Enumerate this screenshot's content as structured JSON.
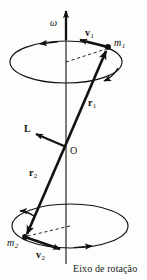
{
  "figure": {
    "kind": "physics-vector-diagram",
    "language": "pt-BR",
    "background_color": "#fdfdfb",
    "ink_color": "#111111",
    "caption": "Eixo de rotação",
    "labels": {
      "omega": "ω",
      "velocity_1": "v",
      "velocity_1_sub": "1",
      "mass_1": "m",
      "mass_1_sub": "1",
      "radius_1": "r",
      "radius_1_sub": "1",
      "angular_momentum": "L",
      "origin": "O",
      "radius_2": "r",
      "radius_2_sub": "2",
      "mass_2": "m",
      "mass_2_sub": "2",
      "velocity_2": "v",
      "velocity_2_sub": "2"
    },
    "geometry": {
      "axis_x": 66,
      "axis_top_y": 8,
      "axis_bottom_y": 272,
      "origin": [
        66,
        144
      ],
      "mass_1_point": [
        108,
        47
      ],
      "mass_2_point": [
        25,
        237
      ],
      "top_orbit": {
        "cx": 66,
        "cy": 62,
        "rx": 56,
        "ry": 21
      },
      "bottom_orbit": {
        "cx": 70,
        "cy": 226,
        "rx": 58,
        "ry": 22
      }
    }
  }
}
